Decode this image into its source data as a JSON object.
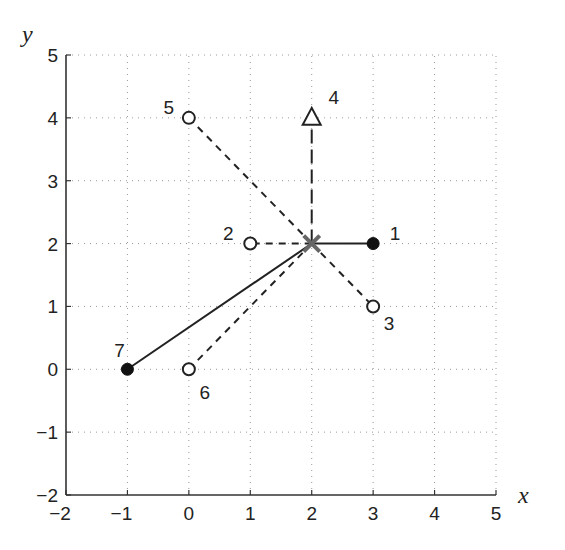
{
  "chart_data": {
    "type": "scatter",
    "title": "",
    "xlabel": "x",
    "ylabel": "y",
    "xlim": [
      -2,
      5
    ],
    "ylim": [
      -2,
      5
    ],
    "grid": true,
    "xticks": [
      "−2",
      "−1",
      "0",
      "1",
      "2",
      "3",
      "4",
      "5"
    ],
    "yticks": [
      "5",
      "4",
      "3",
      "2",
      "1",
      "0",
      "−1",
      "−2"
    ],
    "center": {
      "x": 2,
      "y": 2,
      "marker": "x",
      "color": "#666666"
    },
    "points": [
      {
        "id": "1",
        "x": 3,
        "y": 2,
        "marker": "filled-circle",
        "line": "solid"
      },
      {
        "id": "2",
        "x": 1,
        "y": 2,
        "marker": "open-circle",
        "line": "dashed"
      },
      {
        "id": "3",
        "x": 3,
        "y": 1,
        "marker": "open-circle",
        "line": "dashed"
      },
      {
        "id": "4",
        "x": 2,
        "y": 4,
        "marker": "open-triangle",
        "line": "dash-dot"
      },
      {
        "id": "5",
        "x": 0,
        "y": 4,
        "marker": "open-circle",
        "line": "dashed"
      },
      {
        "id": "6",
        "x": 0,
        "y": 0,
        "marker": "open-circle",
        "line": "dashed"
      },
      {
        "id": "7",
        "x": -1,
        "y": 0,
        "marker": "filled-circle",
        "line": "solid"
      }
    ]
  }
}
